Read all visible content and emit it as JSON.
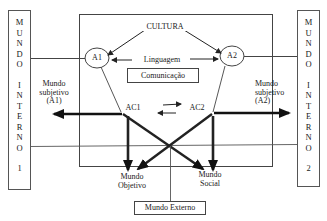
{
  "diagram": {
    "type": "conceptual-communication-model",
    "left_box": {
      "letters": [
        "M",
        "U",
        "N",
        "D",
        "O",
        "",
        "I",
        "N",
        "T",
        "E",
        "R",
        "N",
        "O",
        "",
        "1"
      ],
      "label": "MUNDO INTERNO 1"
    },
    "right_box": {
      "letters": [
        "M",
        "U",
        "N",
        "D",
        "O",
        "",
        "I",
        "N",
        "T",
        "E",
        "R",
        "N",
        "O",
        "",
        "2"
      ],
      "label": "MUNDO INTERNO 2"
    },
    "top_label": "CULTURA",
    "agent_left": "A1",
    "agent_right": "A2",
    "language_label": "Linguagem",
    "communication_label": "Comunicação",
    "subjective_left": [
      "Mundo",
      "subjetivo",
      "(A1)"
    ],
    "subjective_right": [
      "Mundo",
      "subjetivo",
      "(A2)"
    ],
    "action_left": "AC1",
    "action_right": "AC2",
    "objective_world": [
      "Mundo",
      "Objetivo"
    ],
    "social_world": [
      "Mundo",
      "Social"
    ],
    "external_world": "Mundo Externo",
    "colors": {
      "line": "#333333",
      "thick_arrow": "#222222",
      "background": "#ffffff"
    }
  }
}
